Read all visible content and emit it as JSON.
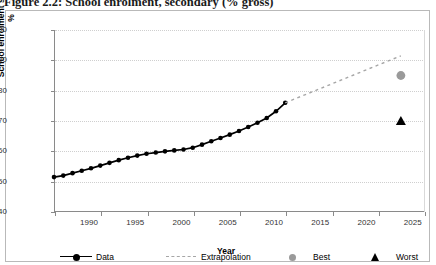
{
  "figure": {
    "caption": "Figure 2.2: School enrolment, secondary (% gross)"
  },
  "legend": {
    "items": [
      {
        "label": "Data",
        "marker": "line-diamond-icon",
        "color": "#000000"
      },
      {
        "label": "Extrapolation",
        "marker": "dashed-line-icon",
        "color": "#a6a6a6"
      },
      {
        "label": "Best",
        "marker": "circle-icon",
        "color": "#9a9a9a"
      },
      {
        "label": "Worst",
        "marker": "triangle-icon",
        "color": "#000000"
      }
    ]
  },
  "chart_data": {
    "type": "line",
    "title": "School enrolment, secondary (% gross)",
    "xlabel": "Year",
    "ylabel": "School enrolment secondary, %",
    "xlim": [
      1990,
      2030
    ],
    "ylim": [
      40,
      100
    ],
    "xticks": [
      1990,
      1995,
      2000,
      2005,
      2010,
      2015,
      2020,
      2025,
      2030
    ],
    "yticks": [
      40,
      50,
      60,
      70,
      80,
      90,
      100
    ],
    "grid": true,
    "legend_position": "bottom",
    "series": [
      {
        "name": "Data",
        "type": "line",
        "color": "#000000",
        "marker": "diamond",
        "x": [
          1990,
          1991,
          1992,
          1993,
          1994,
          1995,
          1996,
          1997,
          1998,
          1999,
          2000,
          2001,
          2002,
          2003,
          2004,
          2005,
          2006,
          2007,
          2008,
          2009,
          2010,
          2011,
          2012,
          2013,
          2014,
          2015
        ],
        "values": [
          51.5,
          52.0,
          52.8,
          53.6,
          54.4,
          55.3,
          56.2,
          57.1,
          57.9,
          58.6,
          59.2,
          59.6,
          60.0,
          60.3,
          60.6,
          61.2,
          62.2,
          63.3,
          64.4,
          65.5,
          66.7,
          68.0,
          69.4,
          71.0,
          73.2,
          76.0
        ]
      },
      {
        "name": "Extrapolation",
        "type": "line",
        "color": "#a6a6a6",
        "style": "dashed",
        "x": [
          2015,
          2027.5
        ],
        "values": [
          76.0,
          91.5
        ]
      },
      {
        "name": "Best",
        "type": "scatter",
        "color": "#9a9a9a",
        "marker": "circle",
        "x": [
          2027.5
        ],
        "values": [
          85.0
        ]
      },
      {
        "name": "Worst",
        "type": "scatter",
        "color": "#000000",
        "marker": "triangle",
        "x": [
          2027.5
        ],
        "values": [
          70.0
        ]
      }
    ]
  }
}
